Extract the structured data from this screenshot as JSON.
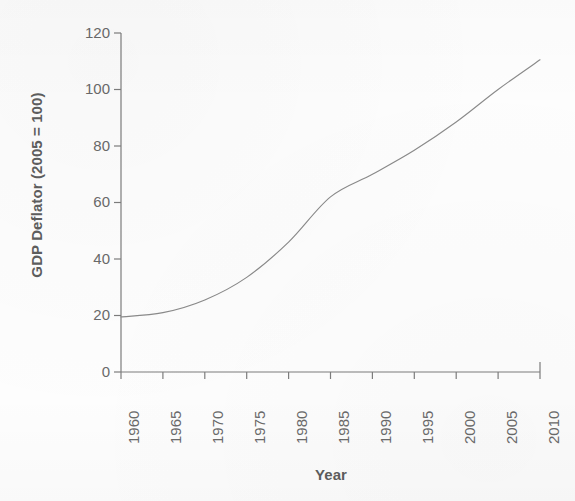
{
  "figure": {
    "kind": "line-chart",
    "background_color": "#fdfdfd",
    "ink_color": "#6a6a6a",
    "line_color": "#8a8a8a",
    "axis_color": "#7d7d7d"
  },
  "chart_data": {
    "type": "line",
    "title": "",
    "subtitle": "",
    "xlabel": "Year",
    "ylabel": "GDP Deflator (2005 = 100)",
    "x": [
      1960,
      1965,
      1970,
      1975,
      1980,
      1985,
      1990,
      1995,
      2000,
      2005,
      2010
    ],
    "values": [
      19.5,
      21.0,
      25.5,
      33.5,
      46.0,
      62.0,
      70.0,
      78.5,
      88.5,
      100.0,
      110.5
    ],
    "series": [
      {
        "name": "GDP Deflator",
        "values": [
          19.5,
          21.0,
          25.5,
          33.5,
          46.0,
          62.0,
          70.0,
          78.5,
          88.5,
          100.0,
          110.5
        ]
      }
    ],
    "xlim": [
      1960,
      2010
    ],
    "ylim": [
      0,
      120
    ],
    "xticks": [
      1960,
      1965,
      1970,
      1975,
      1980,
      1985,
      1990,
      1995,
      2000,
      2005,
      2010
    ],
    "yticks": [
      0,
      20,
      40,
      60,
      80,
      100,
      120
    ],
    "xtick_labels": [
      "1960",
      "1965",
      "1970",
      "1975",
      "1980",
      "1985",
      "1990",
      "1995",
      "2000",
      "2005",
      "2010"
    ],
    "ytick_labels": [
      "0",
      "20",
      "40",
      "60",
      "80",
      "100",
      "120"
    ],
    "xtick_rotation": 90,
    "grid": false,
    "legend": false,
    "legend_position": "none",
    "markers": false,
    "annotations": []
  },
  "geometry": {
    "plot_left": 121,
    "plot_right": 540,
    "plot_top": 33,
    "plot_bottom": 372
  }
}
